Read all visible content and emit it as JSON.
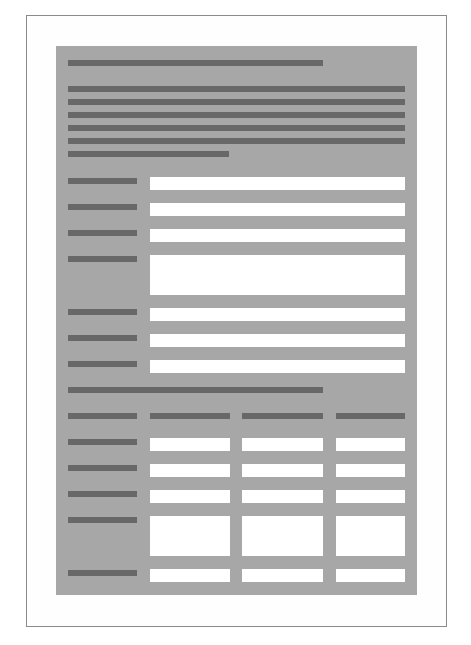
{
  "wireframe": {
    "description": "Grayscale form wireframe with placeholder bars (no legible text)",
    "colors": {
      "page_background": "#ffffff",
      "frame_border": "#8a8a8a",
      "panel_background": "#a7a7a7",
      "placeholder_bar": "#686868",
      "field_background": "#ffffff"
    },
    "title": {
      "placeholder": "title-bar"
    },
    "paragraph": {
      "line_count": 6,
      "placeholder": "text-lines"
    },
    "form_fields": [
      {
        "label": "label-1",
        "type": "single-line"
      },
      {
        "label": "label-2",
        "type": "single-line"
      },
      {
        "label": "label-3",
        "type": "single-line"
      },
      {
        "label": "label-4",
        "type": "multi-line"
      },
      {
        "label": "label-5",
        "type": "single-line"
      },
      {
        "label": "label-6",
        "type": "single-line"
      },
      {
        "label": "label-7",
        "type": "single-line"
      }
    ],
    "section_heading": {
      "placeholder": "section-heading-bar"
    },
    "table": {
      "columns": 3,
      "header": [
        "column-1",
        "column-2",
        "column-3"
      ],
      "rows": [
        {
          "label": "row-1",
          "type": "single-line"
        },
        {
          "label": "row-2",
          "type": "single-line"
        },
        {
          "label": "row-3",
          "type": "single-line"
        },
        {
          "label": "row-4",
          "type": "multi-line"
        },
        {
          "label": "row-5",
          "type": "single-line"
        }
      ]
    }
  }
}
